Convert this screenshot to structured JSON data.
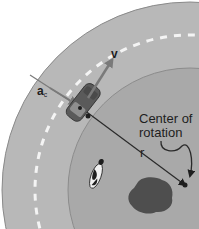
{
  "diagram": {
    "labels": {
      "velocity": "v",
      "centripetal_accel_main": "a",
      "centripetal_accel_sub": "c",
      "radius": "r",
      "center_line1": "Center of",
      "center_line2": "rotation"
    },
    "elements": [
      "curved road",
      "dashed center lane line",
      "car",
      "velocity arrow",
      "radius line",
      "centripetal acceleration arrow",
      "cow",
      "pond",
      "center point"
    ],
    "colors": {
      "background": "#ffffff",
      "road": "#b8b8b8",
      "road_edge": "#8a8a8a",
      "inner_field": "#a9a9a9",
      "lane_dash": "#f4f4f4",
      "car": "#5a5a5a",
      "arrow": "#7a7a7a",
      "line": "#2a2a2a",
      "pond": "#4e4e4e"
    }
  }
}
